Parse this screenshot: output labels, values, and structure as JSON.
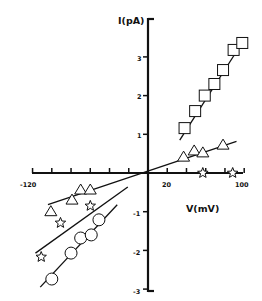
{
  "chart_data": {
    "type": "scatter",
    "title": "",
    "xlabel": "V(mV)",
    "ylabel": "I(pA)",
    "xlim": [
      -120,
      100
    ],
    "ylim": [
      -3,
      3.5
    ],
    "grid": false,
    "legend": null,
    "x_ticks": [
      -120,
      -100,
      -80,
      -60,
      -40,
      -20,
      0,
      20,
      40,
      60,
      80,
      100
    ],
    "x_tick_labels": [
      "-120",
      "20",
      "100"
    ],
    "y_tick_labels": [
      "3",
      "2",
      "1",
      "-1",
      "-2",
      "-3"
    ],
    "y_ticks": [
      3,
      2,
      1,
      -1,
      -2,
      -3
    ],
    "series": [
      {
        "name": "squares",
        "marker": "square",
        "points": [
          [
            38,
            1.16
          ],
          [
            49,
            1.6
          ],
          [
            59,
            2.0
          ],
          [
            69,
            2.3
          ],
          [
            78,
            2.66
          ],
          [
            89,
            3.18
          ],
          [
            98,
            3.36
          ]
        ],
        "fit_line": [
          [
            33,
            0.85
          ],
          [
            100,
            3.45
          ]
        ]
      },
      {
        "name": "triangles",
        "marker": "triangle",
        "points": [
          [
            -101,
            -1.0
          ],
          [
            -79,
            -0.7
          ],
          [
            -70,
            -0.44
          ],
          [
            -60,
            -0.44
          ],
          [
            37,
            0.41
          ],
          [
            48,
            0.57
          ],
          [
            57,
            0.52
          ],
          [
            78,
            0.72
          ]
        ],
        "fit_line": [
          [
            -104,
            -0.82
          ],
          [
            92,
            0.82
          ]
        ]
      },
      {
        "name": "stars",
        "marker": "star",
        "points": [
          [
            -111,
            -2.17
          ],
          [
            -91,
            -1.29
          ],
          [
            -60,
            -0.85
          ],
          [
            57,
            0
          ],
          [
            88,
            0
          ]
        ],
        "fit_line": [
          [
            -117,
            -2.07
          ],
          [
            -21,
            -0.36
          ]
        ]
      },
      {
        "name": "circles",
        "marker": "circle",
        "points": [
          [
            -100,
            -2.74
          ],
          [
            -80,
            -2.07
          ],
          [
            -70,
            -1.68
          ],
          [
            -59,
            -1.6
          ],
          [
            -51,
            -1.21
          ]
        ],
        "fit_line": [
          [
            -112,
            -2.95
          ],
          [
            -32,
            -0.82
          ]
        ]
      }
    ]
  }
}
